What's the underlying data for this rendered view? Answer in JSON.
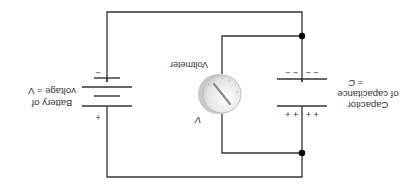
{
  "diagram": {
    "orientation": "rotated 180 degrees",
    "battery": {
      "label_line1": "Battery of",
      "label_line2": "voltage = V",
      "plus_sign": "+",
      "minus_sign": "−"
    },
    "voltmeter": {
      "label": "Voltmeter",
      "reading_symbol": "V"
    },
    "capacitor": {
      "label_line1": "Capacitor",
      "label_line2": "of capacitance",
      "label_line3": "= C",
      "positive_charges": "+ +   + +",
      "negative_charges": "− −   − −"
    },
    "colors": {
      "wire": "#333333",
      "junction": "#000000",
      "meter_face": "#e6e6e6",
      "meter_rim": "#bdbdbd",
      "needle": "#888888",
      "text": "#333333"
    }
  }
}
